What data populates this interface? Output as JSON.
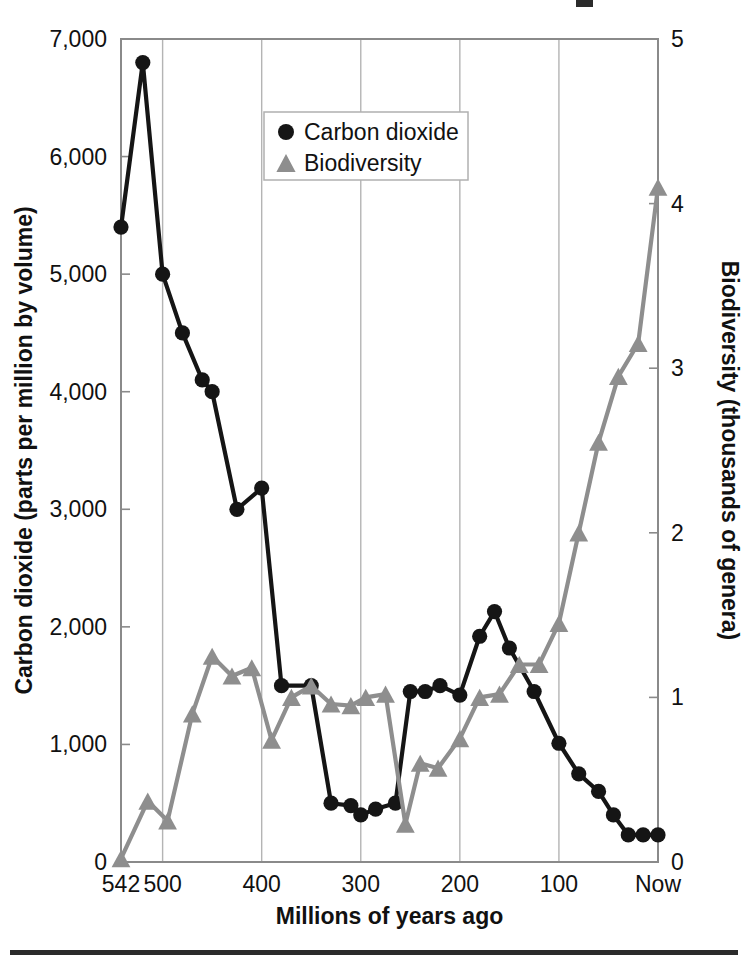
{
  "figure": {
    "bottom_rule": true,
    "colors": {
      "co2": "#151515",
      "biodiversity": "#8e8e8e",
      "frame": "#8a8a8a",
      "gridline": "#b4b4b4",
      "background": "#ffffff"
    }
  },
  "legend": {
    "position": "top-center",
    "entries": [
      {
        "label": "Carbon dioxide",
        "marker": "filled-circle-marker",
        "color": "#151515"
      },
      {
        "label": "Biodiversity",
        "marker": "filled-triangle-marker",
        "color": "#8e8e8e"
      }
    ]
  },
  "chart_data": {
    "type": "line",
    "title": "",
    "xlabel": "Millions of years ago",
    "ylabel": "Carbon dioxide (parts per million by volume)",
    "y2label": "Biodiversity (thousands of genera)",
    "xlim": [
      542,
      0
    ],
    "x_reversed": true,
    "ylim": [
      0,
      7000
    ],
    "y2lim": [
      0,
      5
    ],
    "xticks": [
      542,
      500,
      400,
      300,
      200,
      100,
      0
    ],
    "xticklabels": [
      "542",
      "500",
      "400",
      "300",
      "200",
      "100",
      "Now"
    ],
    "yticks": [
      0,
      1000,
      2000,
      3000,
      4000,
      5000,
      6000,
      7000
    ],
    "yticklabels": [
      "0",
      "1,000",
      "2,000",
      "3,000",
      "4,000",
      "5,000",
      "6,000",
      "7,000"
    ],
    "y2ticks": [
      0,
      1,
      2,
      3,
      4,
      5
    ],
    "y2ticklabels": [
      "0",
      "1",
      "2",
      "3",
      "4",
      "5"
    ],
    "grid": "vertical",
    "legend_position": "top-center",
    "series": [
      {
        "name": "Carbon dioxide",
        "axis": "left",
        "units": "parts per million by volume",
        "marker": "circle",
        "color": "#151515",
        "x": [
          542,
          520,
          500,
          480,
          460,
          450,
          425,
          400,
          380,
          350,
          330,
          310,
          300,
          285,
          265,
          250,
          235,
          220,
          200,
          180,
          165,
          150,
          125,
          100,
          80,
          60,
          45,
          30,
          15,
          0
        ],
        "y": [
          5400,
          6800,
          5000,
          4500,
          4100,
          4000,
          3000,
          3180,
          1500,
          1500,
          500,
          480,
          400,
          450,
          500,
          1450,
          1450,
          1500,
          1420,
          1920,
          2130,
          1820,
          1450,
          1010,
          750,
          600,
          400,
          230,
          230,
          230
        ]
      },
      {
        "name": "Biodiversity",
        "axis": "right",
        "units": "thousands of genera",
        "marker": "triangle",
        "color": "#8e8e8e",
        "x": [
          542,
          515,
          495,
          470,
          450,
          430,
          410,
          390,
          370,
          350,
          330,
          310,
          295,
          275,
          255,
          240,
          222,
          200,
          180,
          160,
          140,
          120,
          100,
          80,
          60,
          40,
          20,
          0
        ],
        "y": [
          0.02,
          0.37,
          0.25,
          0.9,
          1.25,
          1.13,
          1.18,
          0.74,
          1.0,
          1.07,
          0.96,
          0.95,
          1.0,
          1.02,
          0.23,
          0.6,
          0.57,
          0.75,
          1.0,
          1.02,
          1.2,
          1.2,
          1.45,
          2.0,
          2.55,
          2.95,
          3.15,
          4.1
        ]
      }
    ]
  }
}
